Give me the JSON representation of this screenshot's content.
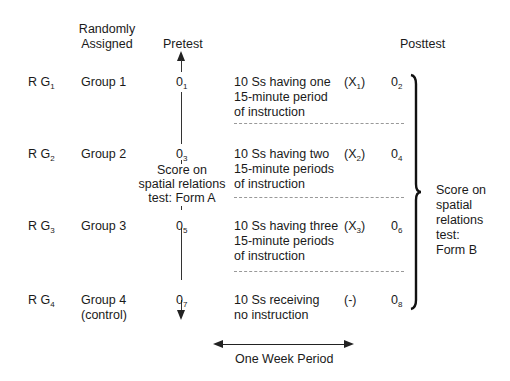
{
  "headers": {
    "assigned_line1": "Randomly",
    "assigned_line2": "Assigned",
    "pretest": "Pretest",
    "posttest": "Posttest"
  },
  "rows": [
    {
      "r": "R G",
      "r_sub": "1",
      "group": "Group 1",
      "group2": "",
      "pre": "0",
      "pre_sub": "1",
      "treat1": "10 Ss having one",
      "treat2": "15-minute period",
      "treat3": "of instruction",
      "x": "(X",
      "x_sub": "1",
      "x_end": ")",
      "post": "0",
      "post_sub": "2"
    },
    {
      "r": "R G",
      "r_sub": "2",
      "group": "Group 2",
      "group2": "",
      "pre": "0",
      "pre_sub": "3",
      "treat1": "10 Ss having two",
      "treat2": "15-minute periods",
      "treat3": "of instruction",
      "x": "(X",
      "x_sub": "2",
      "x_end": ")",
      "post": "0",
      "post_sub": "4"
    },
    {
      "r": "R G",
      "r_sub": "3",
      "group": "Group 3",
      "group2": "",
      "pre": "0",
      "pre_sub": "5",
      "treat1": "10 Ss having three",
      "treat2": "15-minute periods",
      "treat3": "of instruction",
      "x": "(X",
      "x_sub": "3",
      "x_end": ")",
      "post": "0",
      "post_sub": "6"
    },
    {
      "r": "R G",
      "r_sub": "4",
      "group": "Group 4",
      "group2": "(control)",
      "pre": "0",
      "pre_sub": "7",
      "treat1": "10 Ss receiving",
      "treat2": "no instruction",
      "treat3": "",
      "x": "(-)",
      "x_sub": "",
      "x_end": "",
      "post": "0",
      "post_sub": "8"
    }
  ],
  "pretest_label": [
    "Score on",
    "spatial relations",
    "test: Form A"
  ],
  "posttest_label": [
    "Score on",
    "spatial",
    "relations",
    "test:",
    "Form B"
  ],
  "period_label": "One Week Period"
}
